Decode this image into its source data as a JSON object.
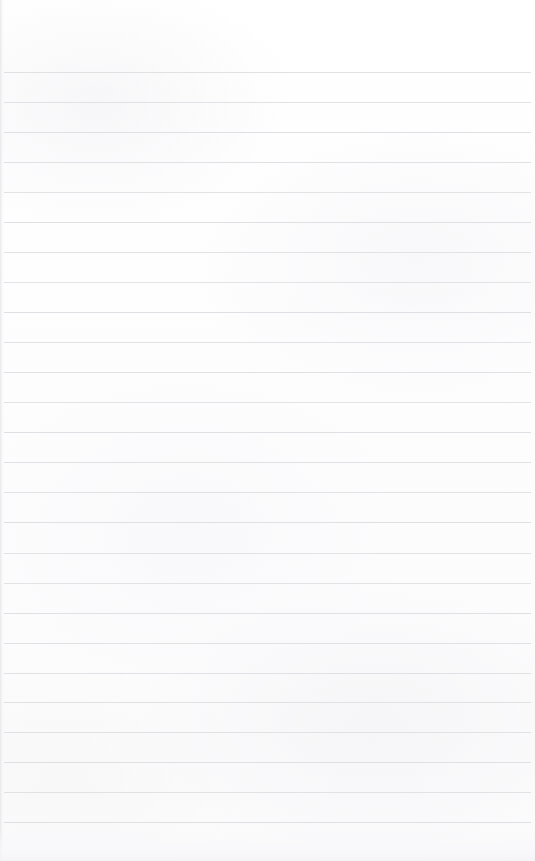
{
  "document": {
    "type": "ruled-notebook-page",
    "title": "Blank Ruled Notebook Page",
    "page_width": 535,
    "page_height": 861,
    "content_text": "",
    "has_written_content": false,
    "has_margin_rule": false,
    "paper_color": "#fdfdfe",
    "rule_line_color": "#dddee1",
    "scan_edge_color": "#e4e5e8"
  },
  "ruling": {
    "line_count": 26,
    "first_line_y": 72,
    "line_spacing": 30,
    "line_thickness": 1,
    "line_start_x": 4,
    "line_end_x": 531,
    "lines": [
      {
        "y": 72,
        "opacity": 0.92
      },
      {
        "y": 102,
        "opacity": 0.88
      },
      {
        "y": 132,
        "opacity": 0.95
      },
      {
        "y": 162,
        "opacity": 0.9
      },
      {
        "y": 192,
        "opacity": 0.86
      },
      {
        "y": 222,
        "opacity": 0.93
      },
      {
        "y": 252,
        "opacity": 0.89
      },
      {
        "y": 282,
        "opacity": 0.84
      },
      {
        "y": 312,
        "opacity": 0.94
      },
      {
        "y": 342,
        "opacity": 0.88
      },
      {
        "y": 372,
        "opacity": 0.91
      },
      {
        "y": 402,
        "opacity": 0.86
      },
      {
        "y": 432,
        "opacity": 0.95
      },
      {
        "y": 462,
        "opacity": 0.9
      },
      {
        "y": 492,
        "opacity": 0.87
      },
      {
        "y": 522,
        "opacity": 0.93
      },
      {
        "y": 553,
        "opacity": 0.89
      },
      {
        "y": 583,
        "opacity": 0.85
      },
      {
        "y": 613,
        "opacity": 0.94
      },
      {
        "y": 643,
        "opacity": 0.9
      },
      {
        "y": 673,
        "opacity": 0.87
      },
      {
        "y": 702,
        "opacity": 0.92
      },
      {
        "y": 732,
        "opacity": 0.88
      },
      {
        "y": 762,
        "opacity": 0.95
      },
      {
        "y": 792,
        "opacity": 0.89
      },
      {
        "y": 822,
        "opacity": 0.93
      }
    ]
  },
  "margins": {
    "top_margin_height": 72,
    "bottom_margin_height": 39,
    "left_margin_width": 4,
    "right_margin_width": 4
  }
}
